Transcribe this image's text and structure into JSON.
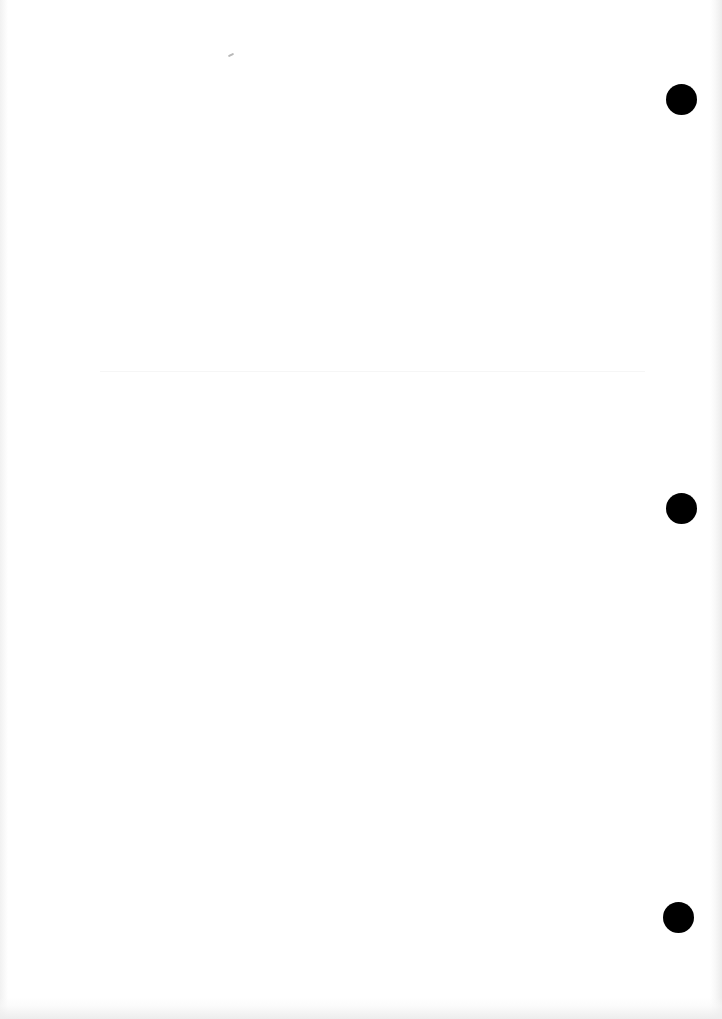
{
  "page": {
    "type": "blank scanned sheet",
    "background_color": "#ffffff",
    "text": ""
  },
  "punch_holes": [
    {
      "name": "top",
      "cx": 681,
      "cy": 99,
      "diameter": 31,
      "color": "#000000"
    },
    {
      "name": "middle",
      "cx": 681,
      "cy": 508,
      "diameter": 31,
      "color": "#000000"
    },
    {
      "name": "bottom",
      "cx": 678,
      "cy": 917,
      "diameter": 31,
      "color": "#000000"
    }
  ]
}
